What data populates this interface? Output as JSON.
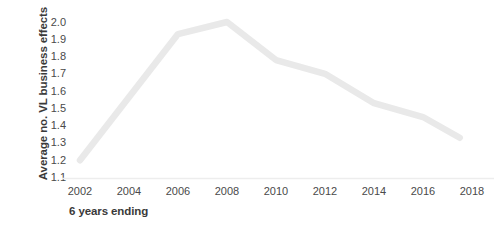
{
  "chart_data": {
    "type": "line",
    "title": "",
    "xlabel": "6 years ending",
    "ylabel": "Average no. VL business effects",
    "xlim": [
      2001.2,
      2018.8
    ],
    "ylim": [
      1.1,
      2.0
    ],
    "grid": false,
    "legend": null,
    "line_color": "#e9e9e9",
    "text_color": "#424242",
    "axis_color": "#ededed",
    "x_ticks": [
      "2002",
      "2004",
      "2006",
      "2008",
      "2010",
      "2012",
      "2014",
      "2016",
      "2018"
    ],
    "x_tick_values": [
      2002,
      2004,
      2006,
      2008,
      2010,
      2012,
      2014,
      2016,
      2018
    ],
    "y_ticks": [
      "2.0",
      "1.9",
      "1.8",
      "1.7",
      "1.6",
      "1.5",
      "1.4",
      "1.3",
      "1.2",
      "1.1"
    ],
    "y_tick_values": [
      2.0,
      1.9,
      1.8,
      1.7,
      1.6,
      1.5,
      1.4,
      1.3,
      1.2,
      1.1
    ],
    "series": [
      {
        "name": "Average no. VL business effects",
        "x": [
          2002,
          2006,
          2008,
          2010,
          2012,
          2014,
          2016,
          2017.5
        ],
        "values": [
          1.2,
          1.93,
          2.0,
          1.78,
          1.7,
          1.53,
          1.45,
          1.33
        ]
      }
    ]
  }
}
